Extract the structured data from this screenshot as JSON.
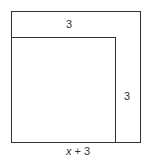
{
  "diagram": {
    "type": "nested-squares",
    "labels": {
      "top_band": "3",
      "right_band": "3",
      "bottom_variable": "x",
      "bottom_rest": " + 3"
    },
    "colors": {
      "stroke": "#333333",
      "background": "#ffffff"
    }
  }
}
